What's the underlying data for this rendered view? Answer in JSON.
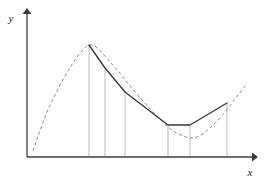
{
  "figure": {
    "title": "",
    "background_color": "#ffffff",
    "width": 265,
    "height": 186
  },
  "axes": {
    "x_axis": {
      "label": "x",
      "label_x": 250,
      "label_y": 176,
      "color": "#3c3c3c",
      "origin_x": 27,
      "origin_y": 157,
      "end_x": 256,
      "arrow": "right-arrow"
    },
    "y_axis": {
      "label": "y",
      "label_x": 11,
      "label_y": 22,
      "color": "#3c3c3c",
      "origin_x": 27,
      "origin_y": 157,
      "end_y": 10,
      "arrow": "up-arrow"
    }
  },
  "chart_data": {
    "type": "line",
    "title": "",
    "xlabel": "x",
    "ylabel": "y",
    "grid": false,
    "legend_position": "none",
    "xlim": [
      27,
      256
    ],
    "ylim": [
      157,
      10
    ],
    "series": [
      {
        "name": "smooth-curve-dashed",
        "style": "dashed",
        "color": "#8a8a8a",
        "linewidth": 1,
        "x": [
          33,
          37,
          42,
          47,
          53,
          59,
          65,
          71,
          77,
          83,
          89,
          96,
          103,
          111,
          119,
          127,
          135,
          143,
          151,
          159,
          167,
          175,
          183,
          190,
          197,
          204,
          211,
          218,
          225,
          232,
          239,
          246
        ],
        "y": [
          151,
          139,
          125,
          112,
          99,
          87,
          76,
          66,
          57,
          50,
          45,
          47,
          54,
          63,
          72,
          82,
          92,
          101,
          110,
          118,
          126,
          132,
          136,
          138,
          137,
          133,
          127,
          120,
          112,
          103,
          94,
          85
        ]
      },
      {
        "name": "piecewise-linear-approximation",
        "style": "solid",
        "color": "#3a3a3a",
        "linewidth": 1.4,
        "nodes_x": [
          89,
          105,
          125,
          168,
          190,
          227
        ],
        "nodes_y": [
          45,
          68,
          92,
          125,
          125,
          103
        ],
        "node_labels": [
          "x0",
          "x1",
          "x2",
          "x3",
          "x4",
          "x5"
        ]
      }
    ],
    "droplines": {
      "name": "vertical-droplines",
      "color": "#bdbdbd",
      "linewidth": 1,
      "baseline_y": 157,
      "lines": [
        {
          "x": 89,
          "top_y": 45
        },
        {
          "x": 105,
          "top_y": 68
        },
        {
          "x": 125,
          "top_y": 92
        },
        {
          "x": 168,
          "top_y": 125
        },
        {
          "x": 190,
          "top_y": 125
        },
        {
          "x": 227,
          "top_y": 103
        }
      ]
    }
  }
}
